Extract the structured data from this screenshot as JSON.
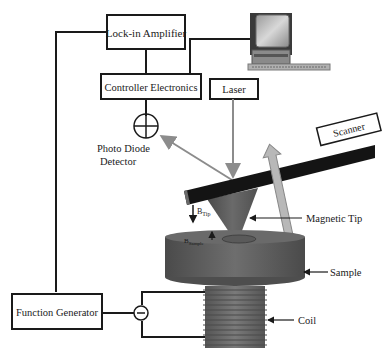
{
  "diagram": {
    "boxes": {
      "lockin": "Lock-in Amplifier",
      "controller": "Controller Electronics",
      "laser": "Laser",
      "scanner": "Scanner",
      "function_generator": "Function Generator"
    },
    "labels": {
      "photodiode_line1": "Photo Diode",
      "photodiode_line2": "Detector",
      "magnetic_tip": "Magnetic Tip",
      "sample": "Sample",
      "coil": "Coil",
      "b_tip": "B",
      "b_tip_sub": "Tip",
      "b_sample": "B",
      "b_sample_sub": "Sample"
    },
    "icons": [
      "computer-icon",
      "photodiode-icon",
      "ac-source-icon",
      "double-arrow-icon"
    ],
    "colors": {
      "line": "#1a1a1a",
      "beam": "#8c8c8c",
      "cantilever": "#141414",
      "tip": "#5a5a5a",
      "sample": "#5e5e5e",
      "coil": "#6a6a6a"
    }
  }
}
